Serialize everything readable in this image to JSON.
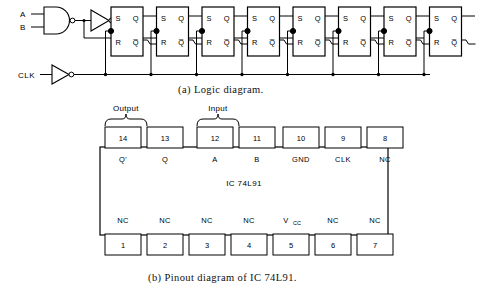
{
  "figure": {
    "caption_a": "(a)  Logic diagram.",
    "caption_b": "(b) Pinout diagram of IC 74L91."
  },
  "logic_diagram": {
    "inputs": [
      {
        "name": "input-a",
        "label": "A"
      },
      {
        "name": "input-b",
        "label": "B"
      },
      {
        "name": "clock-input",
        "label": "CLK"
      }
    ],
    "gates": [
      {
        "name": "and-gate",
        "type": "AND",
        "inputs": [
          "A",
          "B"
        ],
        "inverted_output": true
      },
      {
        "name": "data-inverter",
        "type": "NOT",
        "inverted_output": true
      },
      {
        "name": "clock-inverter",
        "type": "NOT",
        "inverted_output": true
      }
    ],
    "flipflop_count": 8,
    "flipflop_type": "SR",
    "flipflop_pins": {
      "set": "S",
      "reset": "R",
      "q": "Q",
      "qbar": "Q̅"
    },
    "flipflops": [
      {
        "name": "flipflop-1",
        "index": 1
      },
      {
        "name": "flipflop-2",
        "index": 2
      },
      {
        "name": "flipflop-3",
        "index": 3
      },
      {
        "name": "flipflop-4",
        "index": 4
      },
      {
        "name": "flipflop-5",
        "index": 5
      },
      {
        "name": "flipflop-6",
        "index": 6
      },
      {
        "name": "flipflop-7",
        "index": 7
      },
      {
        "name": "flipflop-8",
        "index": 8
      }
    ]
  },
  "pinout_diagram": {
    "ic_label": "IC 74L91",
    "brackets": [
      {
        "name": "output-bracket",
        "label": "Output",
        "pins": [
          "14",
          "13"
        ]
      },
      {
        "name": "input-bracket",
        "label": "Input",
        "pins": [
          "12",
          "11"
        ]
      }
    ],
    "top_pins": [
      {
        "number": "14",
        "label": "Q'"
      },
      {
        "number": "13",
        "label": "Q"
      },
      {
        "number": "12",
        "label": "A"
      },
      {
        "number": "11",
        "label": "B"
      },
      {
        "number": "10",
        "label": "GND"
      },
      {
        "number": "9",
        "label": "CLK"
      },
      {
        "number": "8",
        "label": "NC"
      }
    ],
    "bottom_pins": [
      {
        "number": "1",
        "label": "NC"
      },
      {
        "number": "2",
        "label": "NC"
      },
      {
        "number": "3",
        "label": "NC"
      },
      {
        "number": "4",
        "label": "NC"
      },
      {
        "number": "5",
        "label": "V",
        "sub": "CC"
      },
      {
        "number": "6",
        "label": "NC"
      },
      {
        "number": "7",
        "label": "NC"
      }
    ]
  },
  "colors": {
    "ink": "#000000",
    "paper": "#ffffff"
  }
}
